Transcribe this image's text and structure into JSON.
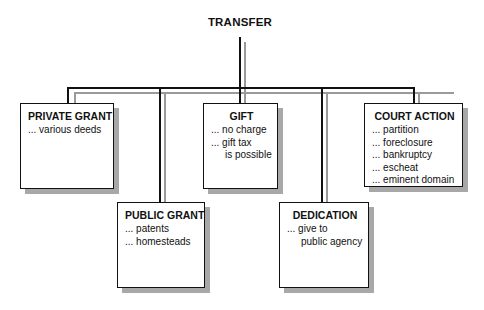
{
  "root": {
    "label": "TRANSFER"
  },
  "nodes": [
    {
      "id": "private-grant",
      "title": "PRIVATE GRANT",
      "items": [
        {
          "text": "... various deeds"
        }
      ]
    },
    {
      "id": "public-grant",
      "title": "PUBLIC GRANT",
      "items": [
        {
          "text": "... patents"
        },
        {
          "text": "... homesteads"
        }
      ]
    },
    {
      "id": "gift",
      "title": "GIFT",
      "items": [
        {
          "text": "... no charge"
        },
        {
          "text": "... gift tax"
        },
        {
          "text": "is possible"
        }
      ]
    },
    {
      "id": "dedication",
      "title": "DEDICATION",
      "items": [
        {
          "text": "... give to"
        },
        {
          "text": "public agency"
        }
      ]
    },
    {
      "id": "court-action",
      "title": "COURT ACTION",
      "items": [
        {
          "text": "... partition"
        },
        {
          "text": "... foreclosure"
        },
        {
          "text": "... bankruptcy"
        },
        {
          "text": "... escheat"
        },
        {
          "text": "... eminent domain"
        }
      ]
    }
  ],
  "colors": {
    "line": "#111111",
    "shadow": "#a8a8a8",
    "background": "#ffffff"
  }
}
